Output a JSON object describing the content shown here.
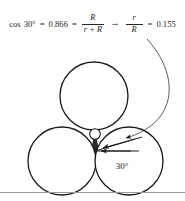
{
  "figure": {
    "equation": {
      "cos_label": "cos",
      "angle": "30°",
      "equals_1": "=",
      "cosine_value": "0.866",
      "equals_2": "=",
      "fraction_1": {
        "numerator": "R",
        "denominator": "r + R"
      },
      "implies_arrow": "→",
      "fraction_2": {
        "numerator": "r",
        "denominator": "R"
      },
      "equals_3": "=",
      "ratio_value": "0.155",
      "plain_text": "cos 30° = 0.866 = R / (r + R) → r / R = 0.155"
    },
    "diagram": {
      "angle_label": "30°",
      "large_circle_count": 3,
      "small_circle_count": 1,
      "large_circles": [
        {
          "name": "top-circle",
          "cx": 94,
          "cy": 58,
          "r": 34
        },
        {
          "name": "lower-left-circle",
          "cx": 62,
          "cy": 123,
          "r": 34
        },
        {
          "name": "lower-right-circle",
          "cx": 129,
          "cy": 123,
          "r": 34
        }
      ],
      "small_circle": {
        "name": "center-small-circle",
        "cx": 95,
        "cy": 96,
        "r": 5.3
      },
      "radial_lines": [
        {
          "name": "horizontal-radius-line",
          "x1": 95,
          "y1": 113,
          "x2": 138,
          "y2": 113
        },
        {
          "name": "angled-radius-line",
          "x1": 95,
          "y1": 113,
          "x2": 141,
          "y2": 99
        }
      ],
      "curved_arrow": {
        "name": "curved-callout-arrow",
        "path": "M 148 2 C 178 34, 180 82, 128 103",
        "from": "equation",
        "to": "center-small-circle"
      },
      "stroke_color": "#1a1a1a",
      "fill_color": "#ffffff",
      "wedge_fill": "#2b2b2b",
      "background": "#ffffff"
    },
    "rule_color": "#9a9a9a"
  }
}
